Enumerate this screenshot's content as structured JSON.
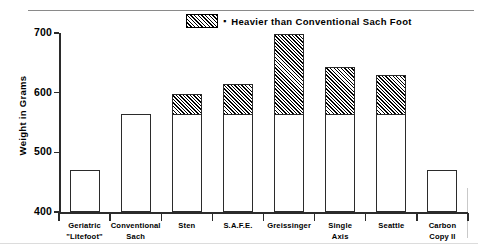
{
  "legend": {
    "equals_symbol": "▪",
    "label": "Heavier than Conventional Sach Foot",
    "swatch_name": "hatched-swatch"
  },
  "axis": {
    "ylabel": "Weight in Grams",
    "yticks": [
      "400",
      "500",
      "600",
      "700"
    ]
  },
  "chart_data": {
    "type": "bar",
    "title": "",
    "subtitle": "",
    "xlabel": "",
    "ylabel": "Weight in Grams",
    "ylim": [
      400,
      700
    ],
    "yticks": [
      400,
      500,
      600,
      700
    ],
    "grid": false,
    "legend_position": "top-center",
    "legend_entries": [
      "Heavier than Conventional Sach Foot"
    ],
    "baseline_reference": 565,
    "baseline_reference_note": "Conventional Sach foot weight; hatched portion of each bar is the excess above this value",
    "categories": [
      "Geriatric “Litefoot”",
      "Conventional Sach",
      "Sten",
      "S.A.F.E.",
      "Greissinger",
      "Single Axis",
      "Seattle",
      "Carbon Copy II"
    ],
    "category_lines": [
      [
        "Geriatric",
        "\"Litefoot\""
      ],
      [
        "Conventional",
        "Sach"
      ],
      [
        "Sten"
      ],
      [
        "S.A.F.E."
      ],
      [
        "Greissinger"
      ],
      [
        "Single",
        "Axis"
      ],
      [
        "Seattle"
      ],
      [
        "Carbon",
        "Copy II"
      ]
    ],
    "values": [
      470,
      565,
      597,
      615,
      698,
      643,
      630,
      470
    ],
    "hatched_above": [
      0,
      0,
      32,
      50,
      133,
      78,
      65,
      0
    ],
    "series": [
      {
        "name": "Weight in Grams",
        "values": [
          470,
          565,
          597,
          615,
          698,
          643,
          630,
          470
        ]
      }
    ]
  },
  "colors": {
    "ink": "#2b2b2b",
    "background": "#ffffff",
    "rule": "#8a8a8a"
  }
}
